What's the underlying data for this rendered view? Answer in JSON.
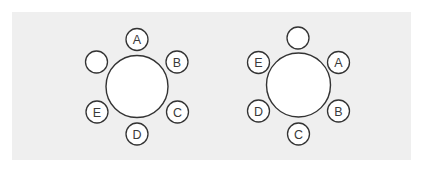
{
  "figure": {
    "background_color": "#ffffff",
    "panel_color": "#efefef",
    "stroke_color": "#333333",
    "label_color": "#3a3a3a",
    "tables": [
      {
        "id": "left-table",
        "center": [
          137,
          86.5
        ],
        "radius": 31,
        "seats": [
          {
            "label": "A",
            "center": [
              137,
              39.5
            ]
          },
          {
            "label": "B",
            "center": [
              177,
              62
            ]
          },
          {
            "label": "C",
            "center": [
              177.5,
              112
            ]
          },
          {
            "label": "D",
            "center": [
              137,
              134
            ]
          },
          {
            "label": "E",
            "center": [
              97,
              112
            ]
          },
          {
            "label": "",
            "center": [
              96.5,
              62
            ]
          }
        ]
      },
      {
        "id": "right-table",
        "center": [
          298.5,
          85
        ],
        "radius": 32,
        "seats": [
          {
            "label": "",
            "center": [
              298,
              38
            ]
          },
          {
            "label": "A",
            "center": [
              338.5,
              62.5
            ]
          },
          {
            "label": "B",
            "center": [
              338.5,
              111
            ]
          },
          {
            "label": "C",
            "center": [
              298.5,
              134
            ]
          },
          {
            "label": "D",
            "center": [
              258.5,
              111
            ]
          },
          {
            "label": "E",
            "center": [
              258.5,
              62.5
            ]
          }
        ]
      }
    ],
    "seat_radius": 11
  }
}
